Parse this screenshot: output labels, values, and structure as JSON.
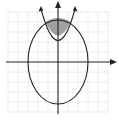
{
  "figure": {
    "grid": {
      "x_min": -5,
      "x_max": 5,
      "y_min": -5,
      "y_max": 5,
      "step": 1
    },
    "ellipse": {
      "center": [
        0,
        0
      ],
      "semi_x": 3,
      "semi_y": 4
    },
    "parabola": {
      "vertex": [
        0,
        2
      ],
      "opens": "up"
    },
    "shaded_region": "inside ellipse and above parabola",
    "colors": {
      "grid": "#c8c8c8",
      "axes": "#222222",
      "curves": "#222222",
      "shade": "#a0a0a0",
      "background": "#ffffff"
    }
  }
}
